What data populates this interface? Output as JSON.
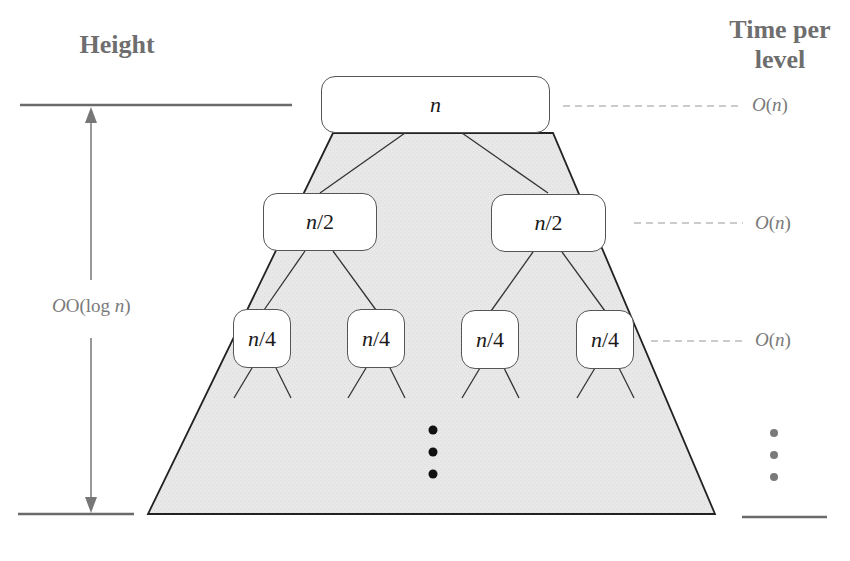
{
  "headers": {
    "height": "Height",
    "time_per_level_line1": "Time per",
    "time_per_level_line2": "level"
  },
  "height_annotation": {
    "label_prefix": "O(log ",
    "label_var": "n",
    "label_suffix": ")"
  },
  "tree": {
    "levels": [
      {
        "nodes": [
          {
            "var": "n",
            "rest": ""
          }
        ],
        "cost_prefix": "O(",
        "cost_var": "n",
        "cost_suffix": ")"
      },
      {
        "nodes": [
          {
            "var": "n",
            "rest": "/2"
          },
          {
            "var": "n",
            "rest": "/2"
          }
        ],
        "cost_prefix": "O(",
        "cost_var": "n",
        "cost_suffix": ")"
      },
      {
        "nodes": [
          {
            "var": "n",
            "rest": "/4"
          },
          {
            "var": "n",
            "rest": "/4"
          },
          {
            "var": "n",
            "rest": "/4"
          },
          {
            "var": "n",
            "rest": "/4"
          }
        ],
        "cost_prefix": "O(",
        "cost_var": "n",
        "cost_suffix": ")"
      }
    ],
    "continuation": "⋮"
  },
  "colors": {
    "trapezoid_fill": "#e6e6e6",
    "outline": "#222222",
    "annotation_gray": "#777777",
    "header_gray": "#6e6e6e"
  }
}
